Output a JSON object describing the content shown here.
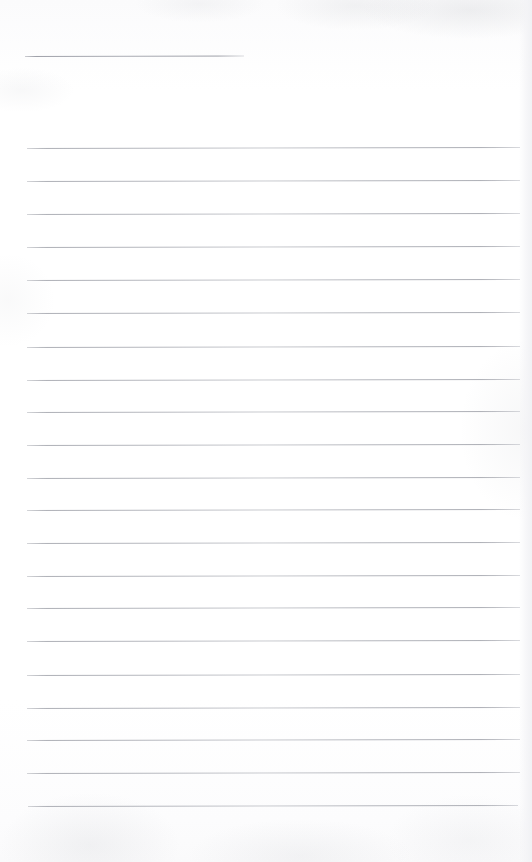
{
  "document": {
    "kind": "scanned-ruled-paper",
    "title": "Blank Ruled Writing Page",
    "page_width": 532,
    "page_height": 862,
    "paper_color": "#fefefe",
    "rule_color": "#b2b4b8",
    "has_handwriting": false,
    "has_printed_text": false,
    "content_text": ""
  },
  "ruling": {
    "left_margin_x": 27,
    "right_margin_x": 520,
    "line_spacing": 32.6,
    "line_thickness": 1,
    "slant_degrees": -0.13,
    "short_rule_count": 1,
    "full_rule_count": 21,
    "total_rule_count": 22
  },
  "rules": [
    {
      "name": "heading-rule",
      "x": 25,
      "y": 56,
      "width": 219,
      "variant": "short"
    },
    {
      "name": "body-rule-1",
      "x": 27,
      "y": 148,
      "width": 493,
      "variant": "full"
    },
    {
      "name": "body-rule-2",
      "x": 27,
      "y": 181,
      "width": 493,
      "variant": "full"
    },
    {
      "name": "body-rule-3",
      "x": 27,
      "y": 214,
      "width": 493,
      "variant": "full"
    },
    {
      "name": "body-rule-4",
      "x": 27,
      "y": 247,
      "width": 493,
      "variant": "full"
    },
    {
      "name": "body-rule-5",
      "x": 27,
      "y": 280,
      "width": 493,
      "variant": "full"
    },
    {
      "name": "body-rule-6",
      "x": 27,
      "y": 313,
      "width": 493,
      "variant": "full"
    },
    {
      "name": "body-rule-7",
      "x": 27,
      "y": 347,
      "width": 493,
      "variant": "full"
    },
    {
      "name": "body-rule-8",
      "x": 27,
      "y": 380,
      "width": 493,
      "variant": "full"
    },
    {
      "name": "body-rule-9",
      "x": 27,
      "y": 412,
      "width": 493,
      "variant": "full"
    },
    {
      "name": "body-rule-10",
      "x": 27,
      "y": 445,
      "width": 493,
      "variant": "full"
    },
    {
      "name": "body-rule-11",
      "x": 27,
      "y": 478,
      "width": 493,
      "variant": "full"
    },
    {
      "name": "body-rule-12",
      "x": 27,
      "y": 510,
      "width": 493,
      "variant": "full"
    },
    {
      "name": "body-rule-13",
      "x": 27,
      "y": 543,
      "width": 493,
      "variant": "full"
    },
    {
      "name": "body-rule-14",
      "x": 27,
      "y": 576,
      "width": 493,
      "variant": "full"
    },
    {
      "name": "body-rule-15",
      "x": 27,
      "y": 608,
      "width": 493,
      "variant": "full"
    },
    {
      "name": "body-rule-16",
      "x": 27,
      "y": 641,
      "width": 493,
      "variant": "full"
    },
    {
      "name": "body-rule-17",
      "x": 27,
      "y": 675,
      "width": 493,
      "variant": "full"
    },
    {
      "name": "body-rule-18",
      "x": 27,
      "y": 708,
      "width": 493,
      "variant": "full"
    },
    {
      "name": "body-rule-19",
      "x": 27,
      "y": 740,
      "width": 493,
      "variant": "full"
    },
    {
      "name": "body-rule-20",
      "x": 27,
      "y": 773,
      "width": 493,
      "variant": "full"
    },
    {
      "name": "body-rule-21",
      "x": 28,
      "y": 806,
      "width": 490,
      "variant": "full"
    }
  ]
}
